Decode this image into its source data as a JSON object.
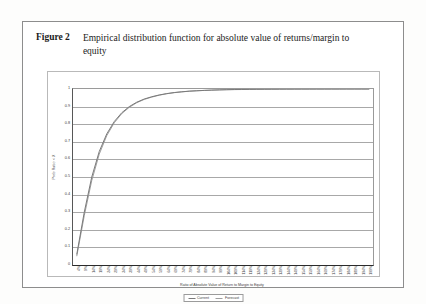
{
  "figure": {
    "number_label": "Figure 2",
    "caption": "Empirical distribution function for absolute value of returns/margin to equity"
  },
  "colors": {
    "current_series": "#7a7a7a",
    "forecast_series": "#9e9e9e",
    "gridline": "#a8a8a8",
    "axis": "#2b2b2b",
    "frame": "#8d8d8d",
    "text": "#3d3d3d"
  },
  "legend": {
    "position": "bottom-center",
    "entries": [
      {
        "label": "Current",
        "color": "#7a7a7a"
      },
      {
        "label": "Forecast",
        "color": "#9e9e9e"
      }
    ]
  },
  "chart_data": {
    "type": "line",
    "title": "",
    "xlabel": "Ratio of Absolute Value of Return to Margin to Equity",
    "ylabel": "Prob Ratio < X",
    "ylim": [
      0,
      1
    ],
    "grid": true,
    "y_ticks": [
      "0",
      "0.1",
      "0.2",
      "0.3",
      "0.4",
      "0.5",
      "0.6",
      "0.7",
      "0.8",
      "0.9",
      "1"
    ],
    "y_tick_values": [
      0,
      0.1,
      0.2,
      0.3,
      0.4,
      0.5,
      0.6,
      0.7,
      0.8,
      0.9,
      1
    ],
    "categories": [
      "4%",
      "9%",
      "14%",
      "19%",
      "24%",
      "29%",
      "34%",
      "39%",
      "44%",
      "49%",
      "54%",
      "59%",
      "64%",
      "69%",
      "74%",
      "79%",
      "84%",
      "89%",
      "94%",
      "99%",
      "104%",
      "109%",
      "114%",
      "119%",
      "124%",
      "129%",
      "134%",
      "139%",
      "144%",
      "149%",
      "154%",
      "159%",
      "164%",
      "169%",
      "174%",
      "179%",
      "184%",
      "189%",
      "194%",
      "199%"
    ],
    "series": [
      {
        "name": "Current",
        "color": "#7a7a7a",
        "values": [
          0.06,
          0.3,
          0.5,
          0.645,
          0.745,
          0.815,
          0.865,
          0.9,
          0.925,
          0.943,
          0.956,
          0.966,
          0.974,
          0.98,
          0.984,
          0.988,
          0.99,
          0.992,
          0.994,
          0.995,
          0.996,
          0.997,
          0.9975,
          0.998,
          0.9984,
          0.9987,
          0.999,
          0.9992,
          0.9993,
          0.9995,
          0.9996,
          0.9996,
          0.9997,
          0.9997,
          0.9998,
          0.9998,
          0.9999,
          0.9999,
          0.9999,
          1.0
        ]
      },
      {
        "name": "Forecast",
        "color": "#9e9e9e",
        "values": [
          0.05,
          0.28,
          0.48,
          0.63,
          0.735,
          0.808,
          0.86,
          0.896,
          0.922,
          0.941,
          0.954,
          0.965,
          0.973,
          0.979,
          0.984,
          0.987,
          0.99,
          0.992,
          0.993,
          0.995,
          0.996,
          0.9965,
          0.997,
          0.9978,
          0.9982,
          0.9986,
          0.9989,
          0.9991,
          0.9993,
          0.9994,
          0.9995,
          0.9996,
          0.9997,
          0.9997,
          0.9998,
          0.9998,
          0.9999,
          0.9999,
          0.9999,
          1.0
        ]
      }
    ]
  }
}
